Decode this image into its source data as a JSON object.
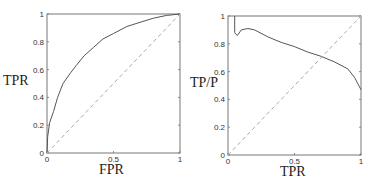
{
  "chart_data": [
    {
      "type": "line",
      "title": "",
      "xlabel": "FPR",
      "ylabel": "TPR",
      "xlim": [
        0,
        1
      ],
      "ylim": [
        0,
        1
      ],
      "x_ticks": [
        "0",
        "0.5",
        "1"
      ],
      "y_ticks": [
        "0",
        "0.2",
        "0.4",
        "0.6",
        "0.8",
        "1"
      ],
      "grid": false,
      "series": [
        {
          "name": "ROC curve",
          "style": "solid",
          "x": [
            0,
            0.005,
            0.02,
            0.05,
            0.08,
            0.12,
            0.18,
            0.22,
            0.28,
            0.35,
            0.42,
            0.5,
            0.6,
            0.7,
            0.8,
            0.9,
            1.0
          ],
          "y": [
            0,
            0.12,
            0.22,
            0.3,
            0.4,
            0.5,
            0.58,
            0.63,
            0.7,
            0.76,
            0.82,
            0.86,
            0.91,
            0.94,
            0.97,
            0.99,
            1.0
          ]
        },
        {
          "name": "chance diagonal",
          "style": "dashed",
          "x": [
            0,
            1
          ],
          "y": [
            0,
            1
          ]
        }
      ]
    },
    {
      "type": "line",
      "title": "",
      "xlabel": "TPR",
      "ylabel": "TP/P",
      "xlim": [
        0,
        1
      ],
      "ylim": [
        0,
        1
      ],
      "x_ticks": [
        "0",
        "0.5",
        "1"
      ],
      "y_ticks": [
        "0",
        "0.2",
        "0.4",
        "0.6",
        "0.8",
        "1"
      ],
      "grid": false,
      "series": [
        {
          "name": "precision curve",
          "style": "solid",
          "x": [
            0.05,
            0.05,
            0.07,
            0.1,
            0.15,
            0.2,
            0.3,
            0.4,
            0.5,
            0.6,
            0.7,
            0.8,
            0.9,
            0.95,
            1.0
          ],
          "y": [
            1.0,
            0.88,
            0.86,
            0.9,
            0.91,
            0.9,
            0.85,
            0.81,
            0.78,
            0.74,
            0.71,
            0.67,
            0.62,
            0.56,
            0.47
          ]
        },
        {
          "name": "diagonal",
          "style": "dashed",
          "x": [
            0,
            1
          ],
          "y": [
            0,
            1
          ]
        }
      ]
    }
  ],
  "plots": [
    {
      "xlabel": "FPR",
      "ylabel": "TPR"
    },
    {
      "xlabel": "TPR",
      "ylabel": "TP/P"
    }
  ]
}
